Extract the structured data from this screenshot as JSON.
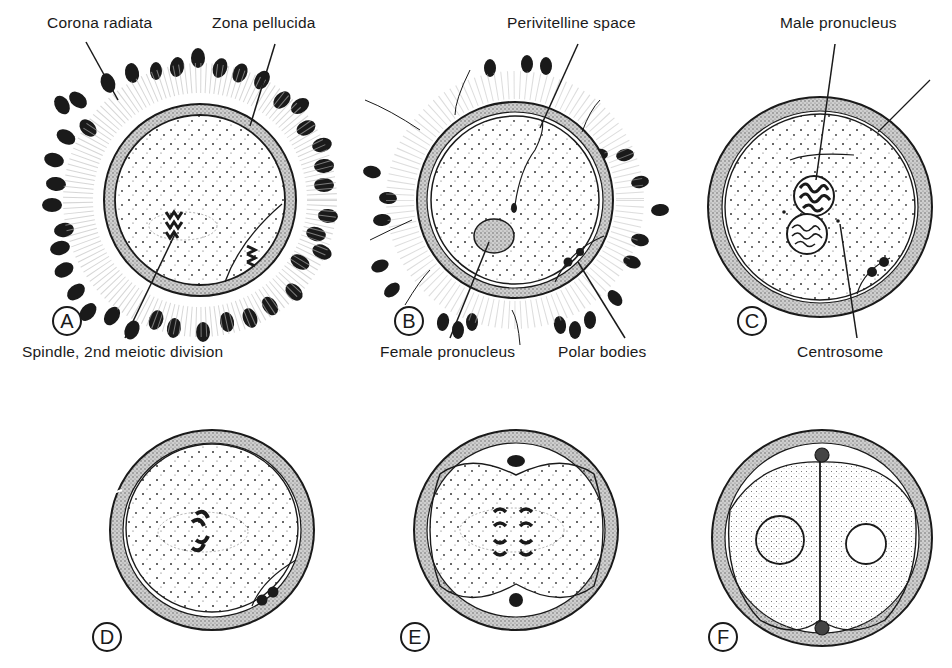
{
  "figure": {
    "panels": [
      {
        "id": "A",
        "letter": "A",
        "labels": [
          "Corona radiata",
          "Zona pellucida",
          "Spindle, 2nd meiotic division"
        ]
      },
      {
        "id": "B",
        "letter": "B",
        "labels": [
          "Perivitelline space",
          "Female pronucleus",
          "Polar bodies"
        ]
      },
      {
        "id": "C",
        "letter": "C",
        "labels": [
          "Male pronucleus",
          "Centrosome"
        ]
      },
      {
        "id": "D",
        "letter": "D",
        "labels": []
      },
      {
        "id": "E",
        "letter": "E",
        "labels": []
      },
      {
        "id": "F",
        "letter": "F",
        "labels": []
      }
    ]
  },
  "labels": {
    "corona_radiata": "Corona radiata",
    "zona_pellucida": "Zona pellucida",
    "spindle": "Spindle, 2nd meiotic division",
    "perivitelline_space": "Perivitelline space",
    "female_pronucleus": "Female pronucleus",
    "polar_bodies": "Polar bodies",
    "male_pronucleus": "Male pronucleus",
    "centrosome": "Centrosome"
  },
  "letters": {
    "a": "A",
    "b": "B",
    "c": "C",
    "d": "D",
    "e": "E",
    "f": "F"
  },
  "colors": {
    "ink": "#1a1a1a",
    "background": "#ffffff",
    "stipple": "#9a9a9a"
  }
}
